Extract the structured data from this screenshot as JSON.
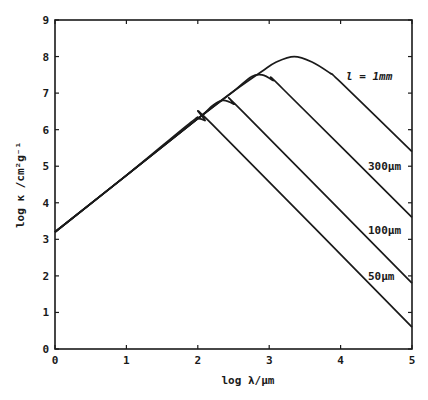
{
  "chart_data": {
    "type": "line",
    "title": "",
    "xlabel": "log λ/µm",
    "ylabel": "log κ /cm²g⁻¹",
    "xlim": [
      0,
      5
    ],
    "ylim": [
      0,
      9
    ],
    "xticks": [
      "0",
      "1",
      "2",
      "3",
      "4",
      "5"
    ],
    "yticks": [
      "0",
      "1",
      "2",
      "3",
      "4",
      "5",
      "6",
      "7",
      "8",
      "9"
    ],
    "grid": false,
    "legend": "inline labels at right",
    "series": [
      {
        "name": "l = 1mm",
        "label": "l = 1mm",
        "points": [
          [
            0,
            3.2
          ],
          [
            1,
            4.75
          ],
          [
            2,
            6.3
          ],
          [
            2.5,
            7.05
          ],
          [
            2.9,
            7.6
          ],
          [
            3.1,
            7.85
          ],
          [
            3.35,
            8.0
          ],
          [
            3.6,
            7.85
          ],
          [
            3.85,
            7.55
          ],
          [
            4.0,
            7.3
          ],
          [
            5,
            5.4
          ]
        ]
      },
      {
        "name": "300µm",
        "label": "300µm",
        "points": [
          [
            0,
            3.2
          ],
          [
            1,
            4.75
          ],
          [
            2,
            6.3
          ],
          [
            2.5,
            7.05
          ],
          [
            2.75,
            7.45
          ],
          [
            2.9,
            7.5
          ],
          [
            3.05,
            7.35
          ],
          [
            3.2,
            7.1
          ],
          [
            5,
            3.6
          ]
        ]
      },
      {
        "name": "100µm",
        "label": "100µm",
        "points": [
          [
            0,
            3.2
          ],
          [
            1,
            4.75
          ],
          [
            2,
            6.3
          ],
          [
            2.2,
            6.65
          ],
          [
            2.35,
            6.8
          ],
          [
            2.5,
            6.7
          ],
          [
            2.65,
            6.45
          ],
          [
            5,
            1.8
          ]
        ]
      },
      {
        "name": "50µm",
        "label": "50µm",
        "points": [
          [
            0,
            3.2
          ],
          [
            1,
            4.75
          ],
          [
            1.9,
            6.2
          ],
          [
            2.0,
            6.3
          ],
          [
            2.1,
            6.25
          ],
          [
            2.25,
            6.05
          ],
          [
            5,
            0.6
          ]
        ]
      }
    ]
  },
  "labels": {
    "x_axis_title": "log λ/µm",
    "y_axis_title": "log κ /cm²g⁻¹",
    "series_1mm": "l = 1mm",
    "series_300": "300µm",
    "series_100": "100µm",
    "series_50": "50µm"
  }
}
